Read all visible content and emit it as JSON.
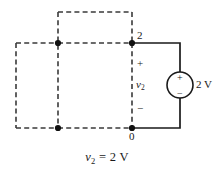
{
  "figure": {
    "type": "circuit-diagram",
    "caption": {
      "variable": "v",
      "subscript": "2",
      "relation": " = 2 V"
    },
    "colors": {
      "wire": "#1a1a1a",
      "dashed": "#3a3a3a",
      "node_dot": "#111111",
      "background": "#ffffff",
      "text": "#1a1a1a"
    }
  },
  "nodes": [
    {
      "id": "node-2",
      "label": "2",
      "x": 132,
      "y": 43
    },
    {
      "id": "node-0",
      "label": "0",
      "x": 132,
      "y": 128
    }
  ],
  "branch_labels": {
    "plus": "+",
    "minus": "−",
    "voltage_var": "v",
    "voltage_sub": "2"
  },
  "source": {
    "name": "voltage-source",
    "label": "2 V",
    "plus": "+",
    "minus": "−",
    "center_x": 180,
    "center_y": 85,
    "radius": 13
  },
  "dashed_network": {
    "description": "two overlapping dashed rectangles representing the rest of the network",
    "rect_top": {
      "x1": 58,
      "y1": 12,
      "x2": 132,
      "y2": 43
    },
    "rect_left": {
      "x1": 16,
      "y1": 43,
      "x2": 58,
      "y2": 128
    },
    "vertical_mid": {
      "x": 58,
      "y1": 12,
      "y2": 128
    },
    "vertical_right": {
      "x": 132,
      "y1": 43,
      "y2": 128
    },
    "horizontal_mid": {
      "y": 43,
      "x1": 16,
      "x2": 132
    },
    "horizontal_bottom": {
      "y": 128,
      "x1": 16,
      "x2": 132
    }
  },
  "junction_dots": [
    {
      "x": 58,
      "y": 43
    },
    {
      "x": 58,
      "y": 128
    },
    {
      "x": 132,
      "y": 43
    },
    {
      "x": 132,
      "y": 128
    }
  ]
}
